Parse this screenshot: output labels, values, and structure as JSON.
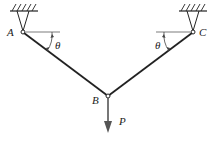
{
  "diagram": {
    "type": "two-bar truss / hanging V cable",
    "labels": {
      "support_left": "A",
      "support_right": "C",
      "joint": "B",
      "load": "P",
      "angle_left": "θ",
      "angle_right": "θ"
    },
    "colors": {
      "member": "#222222",
      "load_arrow": "#555555",
      "background": "#ffffff"
    }
  }
}
